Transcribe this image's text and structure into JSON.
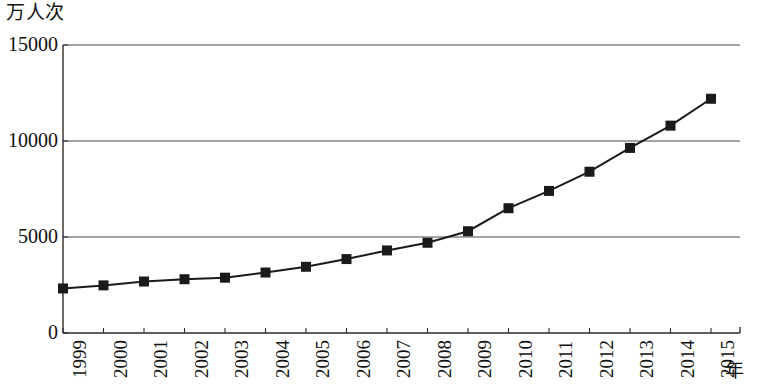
{
  "chart_data": {
    "type": "line",
    "title": "",
    "subtitle": "",
    "ylabel": "万人次",
    "xlabel": "年",
    "grid": true,
    "legend": null,
    "marker": "filled-square",
    "ylim": [
      0,
      15000
    ],
    "y_ticks": [
      "0",
      "5000",
      "10000",
      "15000"
    ],
    "y_tick_values": [
      0,
      5000,
      10000,
      15000
    ],
    "categories": [
      "1999",
      "2000",
      "2001",
      "2002",
      "2003",
      "2004",
      "2005",
      "2006",
      "2007",
      "2008",
      "2009",
      "2010",
      "2011",
      "2012",
      "2013",
      "2014",
      "2015"
    ],
    "values": [
      2320,
      2480,
      2680,
      2800,
      2880,
      3150,
      3450,
      3850,
      4300,
      4700,
      5300,
      6500,
      7400,
      8400,
      9640,
      10800,
      12200
    ],
    "series": [
      {
        "name": "",
        "values": [
          2320,
          2480,
          2680,
          2800,
          2880,
          3150,
          3450,
          3850,
          4300,
          4700,
          5300,
          6500,
          7400,
          8400,
          9640,
          10800,
          12200
        ]
      }
    ]
  },
  "style": {
    "line_color": "#1a1a1a",
    "marker_color": "#1a1a1a",
    "grid_color": "#4a4a4a",
    "axis_color": "#2b2b2b",
    "background": "#ffffff"
  },
  "geometry": {
    "plot_left": 63,
    "plot_right": 740,
    "plot_top": 45,
    "plot_bottom": 333,
    "x_step": 40.5,
    "marker_size": 10
  }
}
